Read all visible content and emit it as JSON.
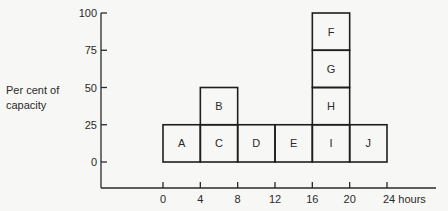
{
  "chart_data": {
    "type": "bar",
    "title": "",
    "xlabel": "hours",
    "ylabel": "Per cent of capacity",
    "ylim": [
      0,
      100
    ],
    "xlim": [
      0,
      24
    ],
    "grid": false,
    "legend": null,
    "x_ticks": [
      {
        "value": 0,
        "label": "0"
      },
      {
        "value": 4,
        "label": "4"
      },
      {
        "value": 8,
        "label": "8"
      },
      {
        "value": 12,
        "label": "12"
      },
      {
        "value": 16,
        "label": "16"
      },
      {
        "value": 20,
        "label": "20"
      },
      {
        "value": 24,
        "label": "24 hours"
      }
    ],
    "y_ticks": [
      {
        "value": 0,
        "label": "0"
      },
      {
        "value": 25,
        "label": "25"
      },
      {
        "value": 50,
        "label": "50"
      },
      {
        "value": 75,
        "label": "75"
      },
      {
        "value": 100,
        "label": "100"
      }
    ],
    "blocks": [
      {
        "label": "A",
        "x0": 0,
        "x1": 4,
        "y0": 0,
        "y1": 25
      },
      {
        "label": "C",
        "x0": 4,
        "x1": 8,
        "y0": 0,
        "y1": 25
      },
      {
        "label": "B",
        "x0": 4,
        "x1": 8,
        "y0": 25,
        "y1": 50
      },
      {
        "label": "D",
        "x0": 8,
        "x1": 12,
        "y0": 0,
        "y1": 25
      },
      {
        "label": "E",
        "x0": 12,
        "x1": 16,
        "y0": 0,
        "y1": 25
      },
      {
        "label": "I",
        "x0": 16,
        "x1": 20,
        "y0": 0,
        "y1": 25
      },
      {
        "label": "H",
        "x0": 16,
        "x1": 20,
        "y0": 25,
        "y1": 50
      },
      {
        "label": "G",
        "x0": 16,
        "x1": 20,
        "y0": 50,
        "y1": 75
      },
      {
        "label": "F",
        "x0": 16,
        "x1": 20,
        "y0": 75,
        "y1": 100
      },
      {
        "label": "J",
        "x0": 20,
        "x1": 24,
        "y0": 0,
        "y1": 25
      }
    ],
    "totals_by_interval": [
      {
        "interval": "0-4",
        "value": 25
      },
      {
        "interval": "4-8",
        "value": 50
      },
      {
        "interval": "8-12",
        "value": 25
      },
      {
        "interval": "12-16",
        "value": 25
      },
      {
        "interval": "16-20",
        "value": 100
      },
      {
        "interval": "20-24",
        "value": 25
      }
    ]
  },
  "labels": {
    "ylabel_line1": "Per cent of",
    "ylabel_line2": "capacity"
  }
}
